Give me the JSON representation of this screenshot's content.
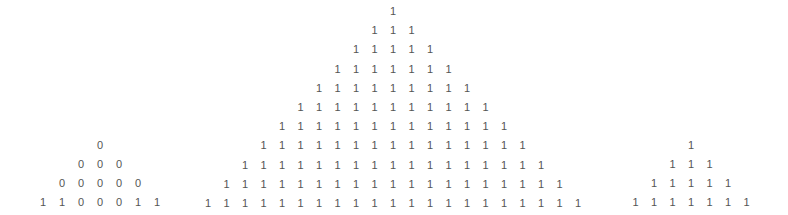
{
  "text_color": "#555555",
  "triangles": [
    {
      "name": "left",
      "center_x": 100,
      "top_y": 139,
      "col_spacing": 19,
      "row_spacing": 19,
      "rows": [
        [
          "0"
        ],
        [
          "0",
          "0",
          "0"
        ],
        [
          "0",
          "0",
          "0",
          "0",
          "0"
        ],
        [
          "1",
          "1",
          "0",
          "0",
          "0",
          "1",
          "1"
        ]
      ]
    },
    {
      "name": "middle",
      "center_x": 393,
      "top_y": 5,
      "col_spacing": 18.5,
      "row_spacing": 19.2,
      "rows": [
        [
          "1"
        ],
        [
          "1",
          "1",
          "1"
        ],
        [
          "1",
          "1",
          "1",
          "1",
          "1"
        ],
        [
          "1",
          "1",
          "1",
          "1",
          "1",
          "1",
          "1"
        ],
        [
          "1",
          "1",
          "1",
          "1",
          "1",
          "1",
          "1",
          "1",
          "1"
        ],
        [
          "1",
          "1",
          "1",
          "1",
          "1",
          "1",
          "1",
          "1",
          "1",
          "1",
          "1"
        ],
        [
          "1",
          "1",
          "1",
          "1",
          "1",
          "1",
          "1",
          "1",
          "1",
          "1",
          "1",
          "1",
          "1"
        ],
        [
          "1",
          "1",
          "1",
          "1",
          "1",
          "1",
          "1",
          "1",
          "1",
          "1",
          "1",
          "1",
          "1",
          "1",
          "1"
        ],
        [
          "1",
          "1",
          "1",
          "1",
          "1",
          "1",
          "1",
          "1",
          "1",
          "1",
          "1",
          "1",
          "1",
          "1",
          "1",
          "1",
          "1"
        ],
        [
          "1",
          "1",
          "1",
          "1",
          "1",
          "1",
          "1",
          "1",
          "1",
          "1",
          "1",
          "1",
          "1",
          "1",
          "1",
          "1",
          "1",
          "1",
          "1"
        ],
        [
          "1",
          "1",
          "1",
          "1",
          "1",
          "1",
          "1",
          "1",
          "1",
          "1",
          "1",
          "1",
          "1",
          "1",
          "1",
          "1",
          "1",
          "1",
          "1",
          "1",
          "1"
        ]
      ]
    },
    {
      "name": "right",
      "center_x": 691,
      "top_y": 139,
      "col_spacing": 18.5,
      "row_spacing": 19,
      "rows": [
        [
          "1"
        ],
        [
          "1",
          "1",
          "1"
        ],
        [
          "1",
          "1",
          "1",
          "1",
          "1"
        ],
        [
          "1",
          "1",
          "1",
          "1",
          "1",
          "1",
          "1"
        ]
      ]
    }
  ]
}
